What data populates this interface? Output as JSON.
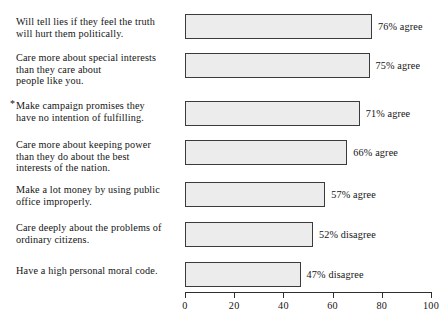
{
  "chart_data": {
    "type": "bar",
    "orientation": "horizontal",
    "title": "",
    "subtitle": "",
    "xlabel": "",
    "ylabel": "",
    "xlim": [
      0,
      100
    ],
    "xticks": [
      0,
      20,
      40,
      60,
      80,
      100
    ],
    "xtick_labels": [
      "0",
      "20",
      "40",
      "60",
      "80",
      "100"
    ],
    "grid": false,
    "legend": "none",
    "bar_fill_color": "#ececec",
    "bar_border_color": "#3b3b3b",
    "categories": [
      "Will tell lies if they feel the truth will hurt them politically.",
      "Care more about special interests than they care about people like you.",
      "Make campaign promises they have no intention of fulfilling.",
      "Care more about keeping power than they do about the best interests of the nation.",
      "Make a lot money by using public office improperly.",
      "Care deeply about the problems of ordinary citizens.",
      "Have a high personal moral code."
    ],
    "values": [
      76,
      75,
      71,
      66,
      57,
      52,
      47
    ],
    "data_labels": [
      "76% agree",
      "75% agree",
      "71% agree",
      "66% agree",
      "57% agree",
      "52% disagree",
      "47% disagree"
    ],
    "responses": [
      "agree",
      "agree",
      "agree",
      "agree",
      "agree",
      "disagree",
      "disagree"
    ]
  },
  "rows": [
    {
      "marker": "",
      "lines": [
        "Will tell lies if they feel the truth",
        "will hurt them politically."
      ],
      "value": 76,
      "label": "76% agree"
    },
    {
      "marker": "",
      "lines": [
        "Care more about special interests",
        "than they care about",
        "people like you."
      ],
      "value": 75,
      "label": "75% agree"
    },
    {
      "marker": "*",
      "lines": [
        "Make campaign promises they",
        "have no intention of fulfilling."
      ],
      "value": 71,
      "label": "71% agree"
    },
    {
      "marker": "",
      "lines": [
        "Care more about keeping power",
        "than they do about the best",
        "interests of the nation."
      ],
      "value": 66,
      "label": "66% agree"
    },
    {
      "marker": "",
      "lines": [
        "Make a lot money by using public",
        "office improperly."
      ],
      "value": 57,
      "label": "57% agree"
    },
    {
      "marker": "",
      "lines": [
        "Care deeply about the problems of",
        "ordinary citizens."
      ],
      "value": 52,
      "label": "52% disagree"
    },
    {
      "marker": "",
      "lines": [
        "Have a high personal moral code."
      ],
      "value": 47,
      "label": "47% disagree"
    }
  ],
  "axis": {
    "ticks": [
      "0",
      "20",
      "40",
      "60",
      "80",
      "100"
    ]
  }
}
